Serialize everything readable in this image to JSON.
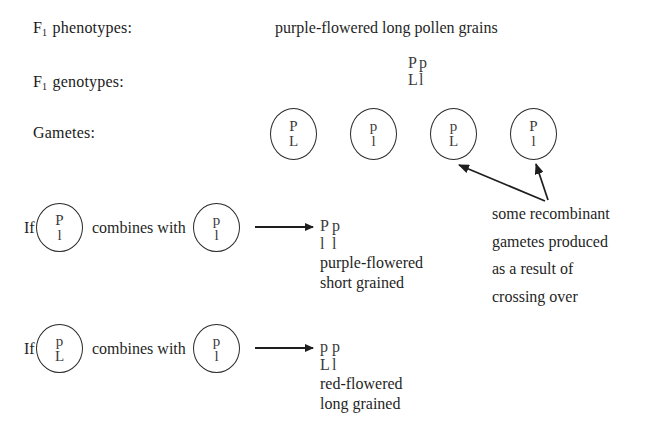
{
  "figure": {
    "background": "#ffffff",
    "ink": "#1e1e1e"
  },
  "rows": {
    "phenotypes": {
      "label_prefix": "F",
      "label_sub": "1",
      "label_suffix": " phenotypes:",
      "value": "purple-flowered long pollen grains"
    },
    "genotypes": {
      "label_prefix": "F",
      "label_sub": "1",
      "label_suffix": " genotypes:",
      "top": {
        "left": "P",
        "right": "p"
      },
      "bottom": {
        "left": "L",
        "right": "l"
      }
    },
    "gametes": {
      "label": "Gametes:",
      "items": [
        {
          "top": "P",
          "bottom": "L",
          "recombinant": false
        },
        {
          "top": "p",
          "bottom": "l",
          "recombinant": false
        },
        {
          "top": "p",
          "bottom": "L",
          "recombinant": true
        },
        {
          "top": "P",
          "bottom": "l",
          "recombinant": true
        }
      ]
    }
  },
  "annotation": {
    "lines": [
      "some recombinant",
      "gametes produced",
      "as a result of",
      "crossing over"
    ]
  },
  "crosses": [
    {
      "if_label": "If",
      "combines_label": "combines with",
      "gamete_a": {
        "top": "P",
        "bottom": "l"
      },
      "gamete_b": {
        "top": "p",
        "bottom": "l"
      },
      "result": {
        "top": {
          "left": "P",
          "right": "p"
        },
        "bottom": {
          "left": "l",
          "right": "l"
        },
        "descr_line1": "purple-flowered",
        "descr_line2": "short grained"
      }
    },
    {
      "if_label": "If",
      "combines_label": "combines with",
      "gamete_a": {
        "top": "p",
        "bottom": "L"
      },
      "gamete_b": {
        "top": "p",
        "bottom": "l"
      },
      "result": {
        "top": {
          "left": "p",
          "right": "p"
        },
        "bottom": {
          "left": "L",
          "right": "l"
        },
        "descr_line1": "red-flowered",
        "descr_line2": "long grained"
      }
    }
  ]
}
